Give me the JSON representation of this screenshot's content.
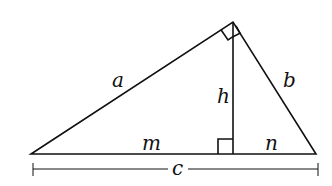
{
  "diagram": {
    "type": "right-triangle-altitude",
    "vertices": {
      "left": [
        31,
        154
      ],
      "top": [
        233,
        22
      ],
      "right": [
        316,
        154
      ],
      "foot": [
        233,
        154
      ]
    },
    "labels": {
      "a": "a",
      "b": "b",
      "h": "h",
      "m": "m",
      "n": "n",
      "c": "c"
    },
    "stroke_color": "#111111"
  }
}
